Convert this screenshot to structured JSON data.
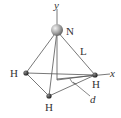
{
  "diagram": {
    "axes": {
      "y_label": "y",
      "x_label": "x"
    },
    "atoms": {
      "nitrogen": {
        "label": "N"
      },
      "h_left": {
        "label": "H"
      },
      "h_right": {
        "label": "H"
      },
      "h_bottom": {
        "label": "H"
      }
    },
    "dimensions": {
      "bond_length": "L",
      "distance": "d"
    },
    "colors": {
      "lines": "#555555",
      "atom_n": "#9a9a9a",
      "atom_h": "#333333",
      "text": "#333333"
    }
  }
}
